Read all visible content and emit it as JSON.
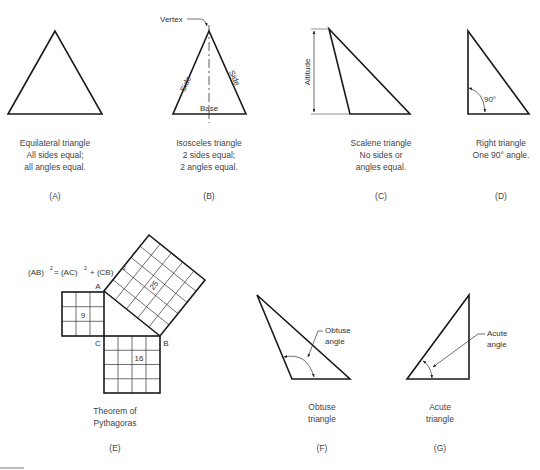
{
  "figures": {
    "A": {
      "caption": [
        "Equilateral triangle",
        "All sides equal;",
        "all angles equal."
      ],
      "label": "(A)"
    },
    "B": {
      "caption": [
        "Isosceles triangle",
        "2 sides equal;",
        "2 angles equal."
      ],
      "label": "(B)",
      "annotations": {
        "vertex": "Vertex",
        "side_left": "Side",
        "side_right": "Side",
        "base": "Base"
      }
    },
    "C": {
      "caption": [
        "Scalene triangle",
        "No sides or",
        "angles equal."
      ],
      "label": "(C)",
      "annotations": {
        "altitude": "Altitude"
      }
    },
    "D": {
      "caption": [
        "Right triangle",
        "One 90° angle."
      ],
      "label": "(D)",
      "annotations": {
        "angle": "90°"
      }
    },
    "E": {
      "caption": [
        "Theorem of",
        "Pythagoras"
      ],
      "label": "(E)",
      "equation": {
        "ab": "(AB)",
        "ac": "= (AC)",
        "cb": "+ (CB)",
        "exp": "2"
      },
      "points": {
        "a": "A",
        "b": "B",
        "c": "C"
      },
      "squares": {
        "ac": "9",
        "cb": "16",
        "ab": "25"
      }
    },
    "F": {
      "caption": [
        "Obtuse",
        "triangle"
      ],
      "label": "(F)",
      "annotations": {
        "angle_line1": "Obtuse",
        "angle_line2": "angle"
      }
    },
    "G": {
      "caption": [
        "Acute",
        "triangle"
      ],
      "label": "(G)",
      "annotations": {
        "angle_line1": "Acute",
        "angle_line2": "angle"
      }
    }
  }
}
